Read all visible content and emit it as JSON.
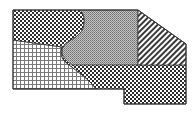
{
  "diagram": {
    "outline_points": "13,10 138,10 186,44 186,104 124,104 124,89 13,89",
    "regions": [
      {
        "id": "checker-top-left",
        "pattern": "checkerboard",
        "fill": "#3a3a3a"
      },
      {
        "id": "stipple-center",
        "pattern": "stipple",
        "fill": "#9a9a9a"
      },
      {
        "id": "diagonal-right",
        "pattern": "diagonal-hatch",
        "fill": "#4a4a4a"
      },
      {
        "id": "checker-bottom-band",
        "pattern": "checkerboard",
        "fill": "#3a3a3a"
      },
      {
        "id": "grid-bottom-left",
        "pattern": "square-grid",
        "fill": "#6a6a6a"
      }
    ],
    "stroke_color": "#333333",
    "background": "#ffffff"
  }
}
